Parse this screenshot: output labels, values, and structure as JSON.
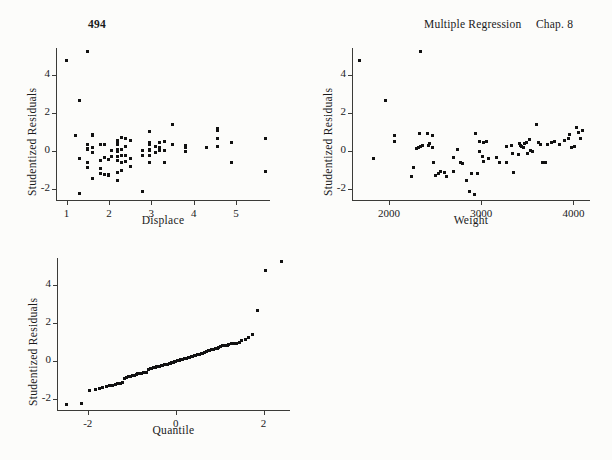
{
  "page": {
    "folio": "494",
    "running_title": "Multiple Regression",
    "chapter": "Chap. 8",
    "background_color": "#fcfcfa",
    "ink_color": "#111111"
  },
  "chart_data": [
    {
      "id": "residuals-vs-displace",
      "type": "scatter",
      "title": "",
      "xlabel": "Displace",
      "ylabel": "Studentized Residuals",
      "xlim": [
        0.75,
        5.8
      ],
      "ylim": [
        -2.6,
        5.4
      ],
      "xticks": [
        1,
        2,
        3,
        4,
        5
      ],
      "yticks": [
        -2,
        0,
        2,
        4
      ],
      "xticklabels": [
        "1",
        "2",
        "3",
        "4",
        "5"
      ],
      "yticklabels": [
        "-2",
        "0",
        "2",
        "4"
      ],
      "grid": false,
      "legend": false,
      "marker": "square",
      "points": [
        [
          1.0,
          4.72
        ],
        [
          1.5,
          5.2
        ],
        [
          1.3,
          2.62
        ],
        [
          1.2,
          0.78
        ],
        [
          1.3,
          -0.4
        ],
        [
          1.3,
          -2.25
        ],
        [
          1.5,
          0.3
        ],
        [
          1.5,
          0.12
        ],
        [
          1.5,
          0.05
        ],
        [
          1.5,
          -0.62
        ],
        [
          1.5,
          -0.9
        ],
        [
          1.6,
          0.85
        ],
        [
          1.6,
          0.78
        ],
        [
          1.6,
          0.18
        ],
        [
          1.6,
          -0.08
        ],
        [
          1.6,
          -1.45
        ],
        [
          1.8,
          0.32
        ],
        [
          1.8,
          -0.52
        ],
        [
          1.8,
          -0.92
        ],
        [
          1.8,
          -1.2
        ],
        [
          1.9,
          0.3
        ],
        [
          1.9,
          -0.35
        ],
        [
          1.9,
          -1.25
        ],
        [
          2.0,
          -0.45
        ],
        [
          2.0,
          -1.3
        ],
        [
          2.0,
          -1.28
        ],
        [
          2.05,
          0.02
        ],
        [
          2.05,
          -0.3
        ],
        [
          2.2,
          0.55
        ],
        [
          2.2,
          0.42
        ],
        [
          2.2,
          0.3
        ],
        [
          2.2,
          0.05
        ],
        [
          2.2,
          -0.05
        ],
        [
          2.2,
          -0.3
        ],
        [
          2.2,
          -0.52
        ],
        [
          2.2,
          -1.15
        ],
        [
          2.2,
          -1.55
        ],
        [
          2.3,
          0.68
        ],
        [
          2.3,
          0.08
        ],
        [
          2.3,
          -0.25
        ],
        [
          2.3,
          -0.62
        ],
        [
          2.3,
          -1.05
        ],
        [
          2.4,
          0.62
        ],
        [
          2.4,
          0.2
        ],
        [
          2.4,
          -0.28
        ],
        [
          2.4,
          -0.55
        ],
        [
          2.5,
          0.52
        ],
        [
          2.5,
          -0.42
        ],
        [
          2.5,
          -0.85
        ],
        [
          2.8,
          0.0
        ],
        [
          2.8,
          -0.25
        ],
        [
          2.8,
          -2.15
        ],
        [
          2.95,
          1.0
        ],
        [
          2.95,
          0.45
        ],
        [
          2.95,
          0.3
        ],
        [
          2.95,
          0.05
        ],
        [
          2.95,
          -0.02
        ],
        [
          2.95,
          -0.25
        ],
        [
          2.95,
          -0.62
        ],
        [
          3.1,
          0.22
        ],
        [
          3.1,
          -0.08
        ],
        [
          3.2,
          0.45
        ],
        [
          3.2,
          0.18
        ],
        [
          3.2,
          0.0
        ],
        [
          3.3,
          0.5
        ],
        [
          3.3,
          -0.02
        ],
        [
          3.3,
          -0.62
        ],
        [
          3.5,
          1.38
        ],
        [
          3.5,
          0.32
        ],
        [
          3.8,
          0.25
        ],
        [
          3.8,
          0.18
        ],
        [
          3.8,
          -0.05
        ],
        [
          4.3,
          0.15
        ],
        [
          4.55,
          1.18
        ],
        [
          4.55,
          1.05
        ],
        [
          4.55,
          0.62
        ],
        [
          4.55,
          0.22
        ],
        [
          4.9,
          0.45
        ],
        [
          4.9,
          -0.65
        ],
        [
          5.7,
          0.65
        ],
        [
          5.7,
          -1.1
        ]
      ]
    },
    {
      "id": "residuals-vs-weight",
      "type": "scatter",
      "title": "",
      "xlabel": "Weight",
      "ylabel": "Studentized Residuals",
      "xlim": [
        1600,
        4180
      ],
      "ylim": [
        -2.6,
        5.4
      ],
      "xticks": [
        2000,
        3000,
        4000
      ],
      "yticks": [
        -2,
        0,
        2,
        4
      ],
      "xticklabels": [
        "2000",
        "3000",
        "4000"
      ],
      "yticklabels": [
        "-2",
        "0",
        "2",
        "4"
      ],
      "grid": false,
      "legend": false,
      "marker": "square",
      "points": [
        [
          1680,
          4.72
        ],
        [
          2340,
          5.2
        ],
        [
          1960,
          2.65
        ],
        [
          1830,
          -0.4
        ],
        [
          2060,
          0.78
        ],
        [
          2060,
          0.48
        ],
        [
          2250,
          -1.35
        ],
        [
          2270,
          -0.9
        ],
        [
          2300,
          0.1
        ],
        [
          2320,
          0.15
        ],
        [
          2340,
          0.2
        ],
        [
          2360,
          0.25
        ],
        [
          2330,
          0.88
        ],
        [
          2420,
          0.92
        ],
        [
          2470,
          0.82
        ],
        [
          2430,
          0.25
        ],
        [
          2440,
          0.35
        ],
        [
          2470,
          0.15
        ],
        [
          2480,
          -0.65
        ],
        [
          2500,
          -1.3
        ],
        [
          2540,
          -1.2
        ],
        [
          2560,
          -1.1
        ],
        [
          2600,
          -1.15
        ],
        [
          2620,
          -1.35
        ],
        [
          2700,
          -1.1
        ],
        [
          2700,
          -0.35
        ],
        [
          2740,
          0.08
        ],
        [
          2780,
          -0.6
        ],
        [
          2800,
          -0.7
        ],
        [
          2840,
          -1.55
        ],
        [
          2870,
          -2.15
        ],
        [
          2930,
          -2.3
        ],
        [
          2900,
          -1.2
        ],
        [
          2960,
          -1.2
        ],
        [
          2940,
          0.9
        ],
        [
          2980,
          0.5
        ],
        [
          2980,
          -0.05
        ],
        [
          3010,
          -0.3
        ],
        [
          3030,
          -0.55
        ],
        [
          3030,
          0.45
        ],
        [
          3060,
          0.5
        ],
        [
          3080,
          -0.4
        ],
        [
          3170,
          -0.35
        ],
        [
          3200,
          -0.6
        ],
        [
          3270,
          -0.6
        ],
        [
          3280,
          0.2
        ],
        [
          3330,
          0.25
        ],
        [
          3340,
          -0.15
        ],
        [
          3350,
          -1.15
        ],
        [
          3400,
          -0.2
        ],
        [
          3420,
          0.35
        ],
        [
          3430,
          0.25
        ],
        [
          3440,
          0.2
        ],
        [
          3460,
          0.15
        ],
        [
          3470,
          0.4
        ],
        [
          3490,
          0.45
        ],
        [
          3500,
          -0.15
        ],
        [
          3520,
          0.58
        ],
        [
          3540,
          0.02
        ],
        [
          3560,
          -0.05
        ],
        [
          3600,
          1.38
        ],
        [
          3620,
          0.45
        ],
        [
          3640,
          0.3
        ],
        [
          3660,
          -0.62
        ],
        [
          3700,
          -0.6
        ],
        [
          3720,
          0.32
        ],
        [
          3760,
          0.45
        ],
        [
          3800,
          0.5
        ],
        [
          3850,
          0.3
        ],
        [
          3900,
          0.55
        ],
        [
          3950,
          0.62
        ],
        [
          3960,
          0.85
        ],
        [
          3980,
          0.15
        ],
        [
          4010,
          0.2
        ],
        [
          4030,
          1.22
        ],
        [
          4060,
          0.95
        ],
        [
          4080,
          0.65
        ],
        [
          4100,
          1.08
        ]
      ]
    },
    {
      "id": "normal-quantile-plot",
      "type": "scatter",
      "title": "",
      "xlabel": "Quantile",
      "ylabel": "Studentized Residuals",
      "xlim": [
        -2.7,
        2.6
      ],
      "ylim": [
        -2.6,
        5.4
      ],
      "xticks": [
        -2,
        0,
        2
      ],
      "yticks": [
        -2,
        0,
        2,
        4
      ],
      "xticklabels": [
        "-2",
        "0",
        "2"
      ],
      "yticklabels": [
        "-2",
        "0",
        "2",
        "4"
      ],
      "grid": false,
      "legend": false,
      "marker": "square",
      "description": "Normal quantile (Q-Q) plot of studentized residuals; near-linear central body with heavy upper tail.",
      "points": [
        [
          -2.48,
          -2.32
        ],
        [
          -2.15,
          -2.25
        ],
        [
          -1.95,
          -1.58
        ],
        [
          -1.82,
          -1.52
        ],
        [
          -1.74,
          -1.48
        ],
        [
          -1.66,
          -1.42
        ],
        [
          -1.58,
          -1.38
        ],
        [
          -1.5,
          -1.33
        ],
        [
          -1.44,
          -1.3
        ],
        [
          -1.38,
          -1.26
        ],
        [
          -1.32,
          -1.22
        ],
        [
          -1.26,
          -1.19
        ],
        [
          -1.21,
          -1.15
        ],
        [
          -1.17,
          -0.92
        ],
        [
          -1.12,
          -0.88
        ],
        [
          -1.07,
          -0.85
        ],
        [
          -1.02,
          -0.82
        ],
        [
          -0.98,
          -0.8
        ],
        [
          -0.94,
          -0.78
        ],
        [
          -0.9,
          -0.72
        ],
        [
          -0.86,
          -0.7
        ],
        [
          -0.82,
          -0.68
        ],
        [
          -0.78,
          -0.66
        ],
        [
          -0.74,
          -0.65
        ],
        [
          -0.7,
          -0.64
        ],
        [
          -0.66,
          -0.63
        ],
        [
          -0.62,
          -0.45
        ],
        [
          -0.58,
          -0.42
        ],
        [
          -0.54,
          -0.4
        ],
        [
          -0.5,
          -0.38
        ],
        [
          -0.46,
          -0.35
        ],
        [
          -0.43,
          -0.33
        ],
        [
          -0.39,
          -0.31
        ],
        [
          -0.36,
          -0.29
        ],
        [
          -0.32,
          -0.27
        ],
        [
          -0.29,
          -0.25
        ],
        [
          -0.25,
          -0.23
        ],
        [
          -0.22,
          -0.2
        ],
        [
          -0.19,
          -0.18
        ],
        [
          -0.15,
          -0.16
        ],
        [
          -0.12,
          -0.13
        ],
        [
          -0.09,
          -0.11
        ],
        [
          -0.06,
          -0.08
        ],
        [
          -0.03,
          -0.06
        ],
        [
          0.0,
          -0.04
        ],
        [
          0.03,
          -0.02
        ],
        [
          0.06,
          0.0
        ],
        [
          0.09,
          0.02
        ],
        [
          0.12,
          0.04
        ],
        [
          0.15,
          0.06
        ],
        [
          0.19,
          0.09
        ],
        [
          0.22,
          0.11
        ],
        [
          0.25,
          0.13
        ],
        [
          0.29,
          0.16
        ],
        [
          0.32,
          0.18
        ],
        [
          0.36,
          0.21
        ],
        [
          0.39,
          0.23
        ],
        [
          0.43,
          0.26
        ],
        [
          0.46,
          0.28
        ],
        [
          0.5,
          0.31
        ],
        [
          0.54,
          0.33
        ],
        [
          0.58,
          0.36
        ],
        [
          0.62,
          0.4
        ],
        [
          0.66,
          0.45
        ],
        [
          0.7,
          0.48
        ],
        [
          0.74,
          0.52
        ],
        [
          0.78,
          0.55
        ],
        [
          0.82,
          0.58
        ],
        [
          0.86,
          0.6
        ],
        [
          0.9,
          0.62
        ],
        [
          0.94,
          0.65
        ],
        [
          0.98,
          0.68
        ],
        [
          1.02,
          0.72
        ],
        [
          1.07,
          0.78
        ],
        [
          1.12,
          0.8
        ],
        [
          1.17,
          0.82
        ],
        [
          1.21,
          0.85
        ],
        [
          1.26,
          0.88
        ],
        [
          1.32,
          0.9
        ],
        [
          1.38,
          0.92
        ],
        [
          1.44,
          0.95
        ],
        [
          1.5,
          1.05
        ],
        [
          1.58,
          1.12
        ],
        [
          1.66,
          1.22
        ],
        [
          1.74,
          1.4
        ],
        [
          1.85,
          2.65
        ],
        [
          2.05,
          4.72
        ],
        [
          2.4,
          5.2
        ]
      ]
    }
  ]
}
